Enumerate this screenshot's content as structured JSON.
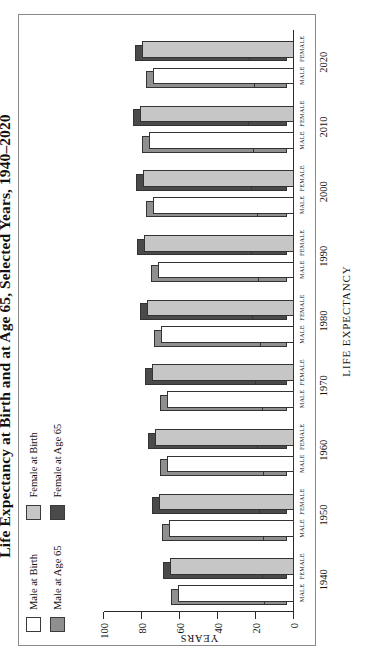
{
  "title": "Life Expectancy at Birth and at Age 65, Selected Years, 1940–2020",
  "orientation_note": "chart rendered rotated 90 degrees counter-clockwise",
  "legend": {
    "position": "top-left inside frame",
    "columns": [
      {
        "entries": [
          {
            "label": "Male at Birth",
            "color": "#ffffff",
            "series_key": "male_birth"
          },
          {
            "label": "Male at Age 65",
            "color": "#8f8f8f",
            "series_key": "male_65"
          }
        ]
      },
      {
        "entries": [
          {
            "label": "Female at Birth",
            "color": "#c6c6c6",
            "series_key": "female_birth"
          },
          {
            "label": "Female at Age 65",
            "color": "#4a4a4a",
            "series_key": "female_65"
          }
        ]
      }
    ]
  },
  "axes": {
    "y_title": "YEARS",
    "x_title": "LIFE EXPECTANCY",
    "y_ticks": [
      0,
      20,
      40,
      60,
      80,
      100
    ],
    "y_min": 0,
    "y_max": 100
  },
  "sub_labels": [
    "MALE",
    "FEMALE"
  ],
  "chart_data": {
    "type": "bar",
    "title": "Life Expectancy at Birth and at Age 65, Selected Years, 1940–2020",
    "xlabel": "LIFE EXPECTANCY",
    "ylabel": "YEARS",
    "ylim": [
      0,
      100
    ],
    "grid": false,
    "legend_position": "top-left",
    "categories": [
      "1940",
      "1950",
      "1960",
      "1970",
      "1980",
      "1990",
      "2000",
      "2010",
      "2020"
    ],
    "subcategories": [
      "MALE",
      "FEMALE"
    ],
    "series": [
      {
        "name": "Male at Birth",
        "color": "#ffffff",
        "values": [
          60.8,
          65.6,
          66.6,
          67.1,
          70.0,
          71.8,
          74.1,
          76.2,
          74.2
        ]
      },
      {
        "name": "Male at Age 65",
        "color": "#8f8f8f",
        "values": [
          11.9,
          12.8,
          12.8,
          13.1,
          14.1,
          15.1,
          16.0,
          17.7,
          17.5
        ]
      },
      {
        "name": "Female at Birth",
        "color": "#c6c6c6",
        "values": [
          65.2,
          71.1,
          73.1,
          74.7,
          77.4,
          78.8,
          79.3,
          81.0,
          79.9
        ]
      },
      {
        "name": "Female at Age 65",
        "color": "#4a4a4a",
        "values": [
          13.4,
          15.0,
          15.8,
          17.0,
          18.3,
          18.9,
          19.0,
          20.3,
          20.2
        ]
      }
    ]
  }
}
